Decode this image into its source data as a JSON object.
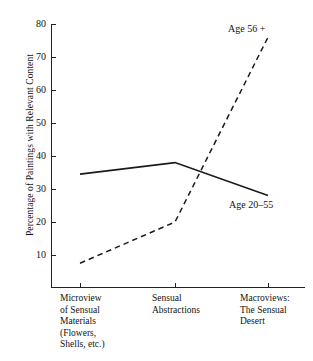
{
  "chart_data": {
    "type": "line",
    "title": "",
    "subtitle": "",
    "xlabel": "",
    "ylabel": "Percentage of Paintings with Relevant Content",
    "ylim": [
      0,
      80
    ],
    "yticks": [
      10,
      20,
      30,
      40,
      50,
      60,
      70,
      80
    ],
    "ytick_labels": [
      "10",
      "20",
      "30",
      "40",
      "50",
      "60",
      "70",
      "80"
    ],
    "grid": false,
    "legend_position": "inline-annotations",
    "categories": [
      "Microview\nof Sensual\nMaterials\n(Flowers,\nShells, etc.)",
      "Sensual\nAbstractions",
      "Macroviews:\nThe Sensual\nDesert"
    ],
    "categories_flat": [
      "Microview of Sensual Materials (Flowers, Shells, etc.)",
      "Sensual Abstractions",
      "Macroviews: The Sensual Desert"
    ],
    "series": [
      {
        "name": "Age 20–55",
        "style": "solid",
        "color": "#1a1a1a",
        "values": [
          34.5,
          38,
          28
        ]
      },
      {
        "name": "Age 56 +",
        "style": "dashed",
        "color": "#1a1a1a",
        "values": [
          7.5,
          20,
          76
        ]
      }
    ],
    "annotations": [
      {
        "text": "Age 56 +",
        "series": "Age 56 +"
      },
      {
        "text": "Age 20–55",
        "series": "Age 20–55"
      }
    ]
  },
  "axes": {
    "y_title": "Percentage of Paintings with Relevant Content",
    "y_labels": [
      "80",
      "70",
      "60",
      "50",
      "40",
      "30",
      "20",
      "10"
    ],
    "x_labels": [
      "Microview\nof Sensual\nMaterials\n(Flowers,\nShells, etc.)",
      "Sensual\nAbstractions",
      "Macroviews:\nThe Sensual\nDesert"
    ]
  },
  "labels": {
    "series_old": "Age 56 +",
    "series_young": "Age 20–55"
  },
  "colors": {
    "ink": "#1a1a1a",
    "axis": "#222222",
    "background": "#ffffff"
  }
}
